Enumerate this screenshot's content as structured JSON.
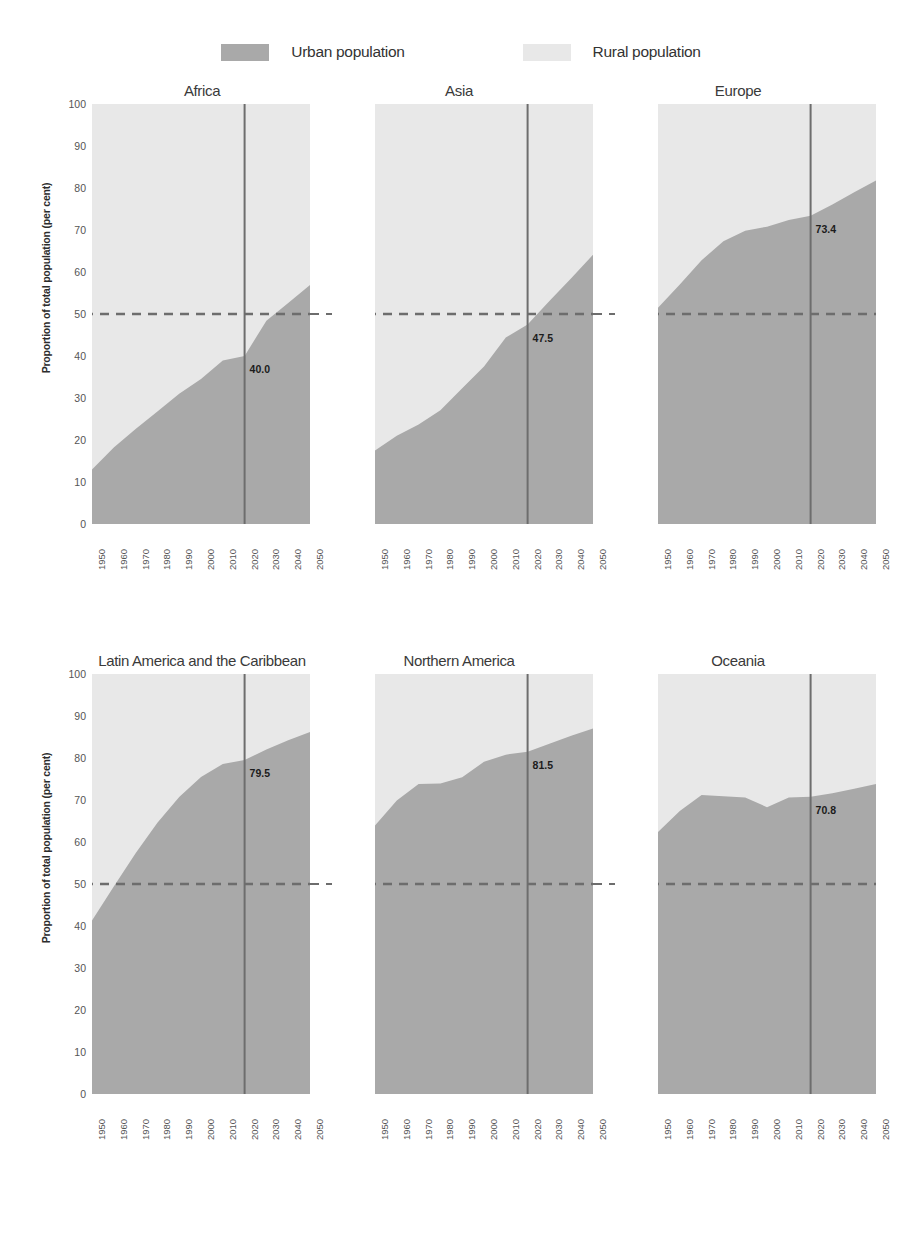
{
  "legend": {
    "items": [
      {
        "label": "Urban population",
        "color": "#a9a9a9",
        "name": "urban"
      },
      {
        "label": "Rural population",
        "color": "#e8e8e8",
        "name": "rural"
      }
    ]
  },
  "axis": {
    "ylabel": "Proportion of total population (per cent)",
    "yticks": [
      "100",
      "90",
      "80",
      "70",
      "60",
      "50",
      "40",
      "30",
      "20",
      "10",
      "0"
    ],
    "xticks": [
      "1950",
      "1960",
      "1970",
      "1980",
      "1990",
      "2000",
      "2010",
      "2020",
      "2030",
      "2040",
      "2050"
    ]
  },
  "style": {
    "urban_color": "#a9a9a9",
    "rural_color": "#e8e8e8",
    "marker_line_color": "#6d6d6d",
    "threshold_line_color": "#6d6d6d"
  },
  "chart_data": {
    "type": "area",
    "xlabel": "",
    "ylabel": "Proportion of total population (per cent)",
    "ylim": [
      0,
      100
    ],
    "xlim": [
      1950,
      2050
    ],
    "grid": false,
    "legend_position": "top-center",
    "x": [
      1950,
      1960,
      1970,
      1980,
      1990,
      2000,
      2010,
      2020,
      2030,
      2040,
      2050
    ],
    "annotations": {
      "threshold_line": {
        "value": 50,
        "style": "dashed",
        "label": "50 per cent"
      },
      "marker_year": {
        "value": 2020,
        "style": "solid vertical line"
      }
    },
    "panels": [
      {
        "name": "Africa",
        "marker_value": "40.0",
        "marker_year": 2020,
        "series": [
          {
            "name": "Urban population",
            "values": [
              13.0,
              18.2,
              22.6,
              26.8,
              31.0,
              34.5,
              38.9,
              40.0,
              48.4,
              52.6,
              56.9
            ]
          },
          {
            "name": "Rural population",
            "values": [
              87.0,
              81.8,
              77.4,
              73.2,
              69.0,
              65.5,
              61.1,
              60.0,
              51.6,
              47.4,
              43.1
            ]
          }
        ]
      },
      {
        "name": "Asia",
        "marker_value": "47.5",
        "marker_year": 2020,
        "series": [
          {
            "name": "Urban population",
            "values": [
              17.5,
              21.0,
              23.7,
              27.1,
              32.3,
              37.5,
              44.4,
              47.5,
              53.1,
              58.5,
              64.1
            ]
          },
          {
            "name": "Rural population",
            "values": [
              82.5,
              79.0,
              76.3,
              72.9,
              67.7,
              62.5,
              55.6,
              52.5,
              46.9,
              41.5,
              35.9
            ]
          }
        ]
      },
      {
        "name": "Europe",
        "marker_value": "73.4",
        "marker_year": 2020,
        "series": [
          {
            "name": "Urban population",
            "values": [
              51.5,
              57.0,
              62.8,
              67.3,
              69.8,
              70.8,
              72.4,
              73.4,
              76.1,
              79.0,
              81.8
            ]
          },
          {
            "name": "Rural population",
            "values": [
              48.5,
              43.0,
              37.2,
              32.7,
              30.2,
              29.2,
              27.6,
              26.6,
              23.9,
              21.0,
              18.2
            ]
          }
        ]
      },
      {
        "name": "Latin America and the Caribbean",
        "marker_value": "79.5",
        "marker_year": 2020,
        "series": [
          {
            "name": "Urban population",
            "values": [
              41.3,
              49.4,
              57.3,
              64.6,
              70.7,
              75.5,
              78.6,
              79.5,
              82.0,
              84.2,
              86.2
            ]
          },
          {
            "name": "Rural population",
            "values": [
              58.7,
              50.6,
              42.7,
              35.4,
              29.3,
              24.5,
              21.4,
              20.5,
              18.0,
              15.8,
              13.8
            ]
          }
        ]
      },
      {
        "name": "Northern America",
        "marker_value": "81.5",
        "marker_year": 2020,
        "series": [
          {
            "name": "Urban population",
            "values": [
              63.9,
              69.9,
              73.8,
              73.9,
              75.4,
              79.1,
              80.8,
              81.5,
              83.4,
              85.3,
              87.0
            ]
          },
          {
            "name": "Rural population",
            "values": [
              36.1,
              30.1,
              26.2,
              26.1,
              24.6,
              20.9,
              19.2,
              18.5,
              16.6,
              14.7,
              13.0
            ]
          }
        ]
      },
      {
        "name": "Oceania",
        "marker_value": "70.8",
        "marker_year": 2020,
        "series": [
          {
            "name": "Urban population",
            "values": [
              62.4,
              67.4,
              71.2,
              70.9,
              70.6,
              68.3,
              70.6,
              70.8,
              71.6,
              72.7,
              73.8
            ]
          },
          {
            "name": "Rural population",
            "values": [
              37.6,
              32.6,
              28.8,
              29.1,
              29.4,
              31.7,
              29.4,
              29.2,
              28.4,
              27.3,
              26.2
            ]
          }
        ]
      }
    ]
  }
}
